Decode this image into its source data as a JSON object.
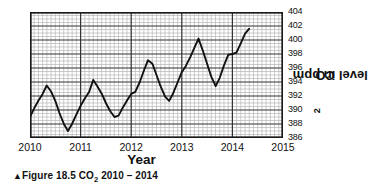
{
  "figure": {
    "caption_marker": "▲",
    "caption_text": "Figure 18.5  CO",
    "caption_sub": "2",
    "caption_tail": "  2010 – 2014",
    "x_axis_label": "Year",
    "y_axis_label_main": "CO",
    "y_axis_label_sub": "2",
    "y_axis_label_tail": " level in ppm",
    "axis_color": "#1a1a1a",
    "grid_major_color": "#333333",
    "grid_minor_color": "#b9b9b9",
    "line_color": "#111111",
    "background_color": "#ffffff"
  },
  "chart_data": {
    "type": "line",
    "title": "Figure 18.5  CO2  2010 – 2014",
    "xlabel": "Year",
    "ylabel": "CO2 level in ppm",
    "xlim": [
      2010,
      2015
    ],
    "ylim": [
      386,
      404
    ],
    "grid": true,
    "legend": "none",
    "x_ticks": [
      "2010",
      "2011",
      "2012",
      "2013",
      "2014",
      "2015"
    ],
    "x_tick_values": [
      2010,
      2011,
      2012,
      2013,
      2014,
      2015
    ],
    "y_ticks": [
      "386",
      "388",
      "390",
      "392",
      "394",
      "396",
      "398",
      "400",
      "402",
      "404"
    ],
    "y_tick_values": [
      386,
      388,
      390,
      392,
      394,
      396,
      398,
      400,
      402,
      404
    ],
    "x_minor_per_major": 12,
    "y_minor_per_major": 4,
    "series": [
      {
        "name": "CO2 level in ppm",
        "x": [
          2010.0,
          2010.08,
          2010.17,
          2010.25,
          2010.33,
          2010.42,
          2010.5,
          2010.58,
          2010.67,
          2010.75,
          2010.83,
          2010.92,
          2011.0,
          2011.08,
          2011.17,
          2011.25,
          2011.33,
          2011.42,
          2011.5,
          2011.58,
          2011.67,
          2011.75,
          2011.83,
          2011.92,
          2012.0,
          2012.08,
          2012.17,
          2012.25,
          2012.33,
          2012.42,
          2012.5,
          2012.58,
          2012.67,
          2012.75,
          2012.83,
          2012.92,
          2013.0,
          2013.08,
          2013.17,
          2013.25,
          2013.33,
          2013.42,
          2013.5,
          2013.58,
          2013.67,
          2013.75,
          2013.83,
          2013.92,
          2014.0,
          2014.08,
          2014.17,
          2014.25,
          2014.33
        ],
        "y": [
          389.0,
          390.2,
          391.4,
          392.3,
          393.5,
          392.6,
          391.3,
          389.6,
          388.0,
          387.0,
          388.0,
          389.4,
          390.6,
          391.6,
          392.6,
          394.3,
          393.4,
          392.3,
          391.0,
          389.9,
          389.0,
          389.2,
          390.3,
          391.4,
          392.3,
          392.6,
          394.0,
          395.6,
          397.1,
          396.6,
          395.0,
          393.4,
          391.9,
          391.3,
          392.4,
          394.0,
          395.4,
          396.3,
          397.6,
          398.9,
          400.2,
          398.4,
          396.6,
          394.8,
          393.4,
          394.6,
          396.3,
          397.9,
          398.0,
          398.2,
          399.6,
          400.9,
          401.6
        ]
      }
    ]
  }
}
